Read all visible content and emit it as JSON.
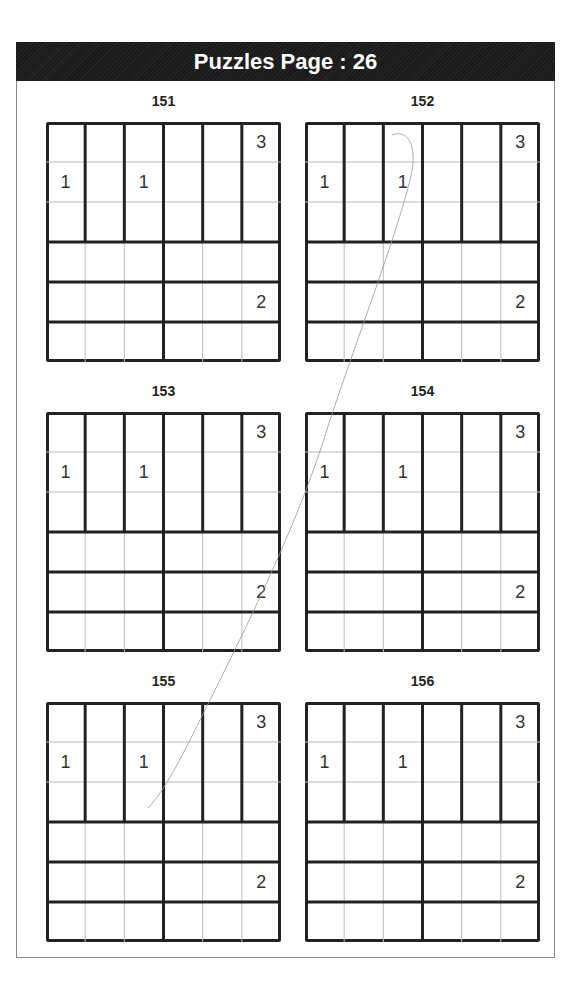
{
  "header": {
    "title": "Puzzles Page :  26"
  },
  "puzzles": [
    {
      "id": "151",
      "clues": [
        {
          "r": 0,
          "c": 5,
          "v": "3"
        },
        {
          "r": 1,
          "c": 0,
          "v": "1"
        },
        {
          "r": 1,
          "c": 2,
          "v": "1"
        },
        {
          "r": 4,
          "c": 5,
          "v": "2"
        }
      ]
    },
    {
      "id": "152",
      "clues": [
        {
          "r": 0,
          "c": 5,
          "v": "3"
        },
        {
          "r": 1,
          "c": 0,
          "v": "1"
        },
        {
          "r": 1,
          "c": 2,
          "v": "1"
        },
        {
          "r": 4,
          "c": 5,
          "v": "2"
        }
      ]
    },
    {
      "id": "153",
      "clues": [
        {
          "r": 0,
          "c": 5,
          "v": "3"
        },
        {
          "r": 1,
          "c": 0,
          "v": "1"
        },
        {
          "r": 1,
          "c": 2,
          "v": "1"
        },
        {
          "r": 4,
          "c": 5,
          "v": "2"
        }
      ]
    },
    {
      "id": "154",
      "clues": [
        {
          "r": 0,
          "c": 5,
          "v": "3"
        },
        {
          "r": 1,
          "c": 0,
          "v": "1"
        },
        {
          "r": 1,
          "c": 2,
          "v": "1"
        },
        {
          "r": 4,
          "c": 5,
          "v": "2"
        }
      ]
    },
    {
      "id": "155",
      "clues": [
        {
          "r": 0,
          "c": 5,
          "v": "3"
        },
        {
          "r": 1,
          "c": 0,
          "v": "1"
        },
        {
          "r": 1,
          "c": 2,
          "v": "1"
        },
        {
          "r": 4,
          "c": 5,
          "v": "2"
        }
      ]
    },
    {
      "id": "156",
      "clues": [
        {
          "r": 0,
          "c": 5,
          "v": "3"
        },
        {
          "r": 1,
          "c": 0,
          "v": "1"
        },
        {
          "r": 1,
          "c": 2,
          "v": "1"
        },
        {
          "r": 4,
          "c": 5,
          "v": "2"
        }
      ]
    }
  ],
  "layout": {
    "grid_size": 6,
    "region_note": "top half: six 1x3 vertical regions; bottom half: 2x3 horizontal strips split into two 1x3 regions per row"
  }
}
